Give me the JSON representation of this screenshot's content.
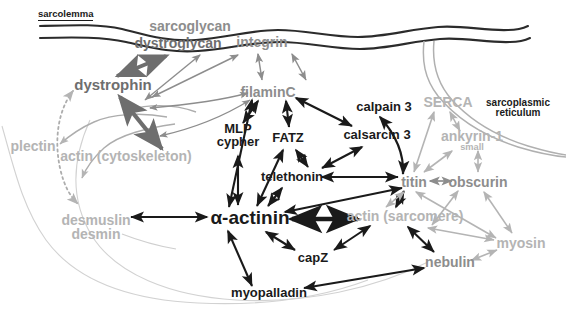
{
  "figure": {
    "type": "biological-interaction-diagram",
    "background_color": "#ffffff"
  },
  "colors": {
    "black": "#1a1a1a",
    "dark_gray": "#6e6e6e",
    "mid_gray": "#8d8d8d",
    "light_gray": "#b4b4b4",
    "membrane": "#2b2b2b"
  },
  "structures": [
    {
      "id": "sarcolemma",
      "label": "sarcolemma",
      "tone": "black",
      "x": 70,
      "y": 16,
      "size": 9.5
    },
    {
      "id": "sarcoplasmic-reticulum",
      "label": "sarcoplasmic\nreticulum",
      "line1": "sarcoplasmic",
      "line2": "reticulum",
      "tone": "black",
      "x": 518,
      "y": 108,
      "size": 10
    }
  ],
  "nodes": [
    {
      "id": "sarcoglycan",
      "label": "sarcoglycan",
      "tone": "mid",
      "x": 190,
      "y": 26,
      "size": 14
    },
    {
      "id": "dystroglycan",
      "label": "dystroglycan",
      "tone": "dark",
      "x": 178,
      "y": 43,
      "size": 14
    },
    {
      "id": "integrin",
      "label": "integrin",
      "tone": "mid",
      "x": 262,
      "y": 42,
      "size": 14
    },
    {
      "id": "dystrophin",
      "label": "dystrophin",
      "tone": "dark",
      "x": 113,
      "y": 85,
      "size": 15
    },
    {
      "id": "filaminC",
      "label": "filaminC",
      "tone": "mid",
      "x": 268,
      "y": 92,
      "size": 14
    },
    {
      "id": "calpain-3",
      "label": "calpain 3",
      "tone": "black",
      "x": 384,
      "y": 107,
      "size": 13
    },
    {
      "id": "serca",
      "label": "SERCA",
      "tone": "light",
      "x": 448,
      "y": 102,
      "size": 14
    },
    {
      "id": "plectin",
      "label": "plectin",
      "tone": "light",
      "x": 33,
      "y": 146,
      "size": 14
    },
    {
      "id": "mlp-cypher",
      "label": "MLP cypher",
      "line1": "MLP",
      "line2": "cypher",
      "tone": "black",
      "x": 238,
      "y": 135,
      "size": 13
    },
    {
      "id": "fatz",
      "label": "FATZ",
      "tone": "black",
      "x": 288,
      "y": 138,
      "size": 13
    },
    {
      "id": "calsarcin-3",
      "label": "calsarcin 3",
      "tone": "black",
      "x": 377,
      "y": 135,
      "size": 13
    },
    {
      "id": "ankyrin-1-small",
      "label": "ankyrin-1small",
      "base": "ankyrin-1",
      "subscript": "small",
      "tone": "light",
      "x": 472,
      "y": 141,
      "size": 14
    },
    {
      "id": "actin-cytoskeleton",
      "label": "actin (cytoskeleton)",
      "tone": "light",
      "x": 126,
      "y": 156,
      "size": 14
    },
    {
      "id": "telethonin",
      "label": "telethonin",
      "tone": "black",
      "x": 292,
      "y": 177,
      "size": 13
    },
    {
      "id": "titin",
      "label": "titin",
      "tone": "mid",
      "x": 414,
      "y": 182,
      "size": 14
    },
    {
      "id": "obscurin",
      "label": "obscurin",
      "tone": "mid",
      "x": 478,
      "y": 182,
      "size": 14
    },
    {
      "id": "alpha-actinin",
      "label": "α-actinin",
      "tone": "black",
      "x": 250,
      "y": 218,
      "size": 19
    },
    {
      "id": "actin-sarcomere",
      "label": "actin (sarcomere)",
      "tone": "light",
      "x": 405,
      "y": 216,
      "size": 14
    },
    {
      "id": "desmuslin-desmin",
      "label": "desmuslin desmin",
      "line1": "desmuslin",
      "line2": "desmin",
      "tone": "light",
      "x": 96,
      "y": 227,
      "size": 14
    },
    {
      "id": "myosin",
      "label": "myosin",
      "tone": "light",
      "x": 521,
      "y": 243,
      "size": 14
    },
    {
      "id": "capz",
      "label": "capZ",
      "tone": "black",
      "x": 313,
      "y": 258,
      "size": 13
    },
    {
      "id": "nebulin",
      "label": "nebulin",
      "tone": "mid",
      "x": 450,
      "y": 262,
      "size": 14
    },
    {
      "id": "myopalladin",
      "label": "myopalladin",
      "tone": "black",
      "x": 269,
      "y": 293,
      "size": 13
    }
  ],
  "edges": [
    {
      "from": "dystroglycan",
      "to": "dystrophin",
      "arrow": "double",
      "tone": "dark",
      "weight": "thick"
    },
    {
      "from": "integrin",
      "to": "filaminC",
      "arrow": "double",
      "tone": "mid",
      "weight": "thin"
    },
    {
      "from": "integrin",
      "to": "filaminC-right",
      "arrow": "double",
      "tone": "mid",
      "weight": "thin"
    },
    {
      "from": "dystroglycan",
      "to": "actin-cytoskeleton",
      "arrow": "double",
      "tone": "mid",
      "weight": "thin"
    },
    {
      "from": "integrin-left",
      "to": "actin-cytoskeleton",
      "arrow": "double",
      "tone": "mid",
      "weight": "thin"
    },
    {
      "from": "dystrophin",
      "to": "actin-cytoskeleton",
      "arrow": "double",
      "tone": "dark",
      "weight": "thick"
    },
    {
      "from": "plectin",
      "to": "actin-cytoskeleton",
      "arrow": "double",
      "tone": "light",
      "weight": "thin"
    },
    {
      "from": "plectin",
      "to": "desmuslin-desmin",
      "arrow": "double",
      "tone": "light",
      "weight": "dotted"
    },
    {
      "from": "filaminC",
      "to": "mlp-cypher",
      "arrow": "double",
      "tone": "black",
      "weight": "thin"
    },
    {
      "from": "filaminC",
      "to": "fatz",
      "arrow": "double",
      "tone": "black",
      "weight": "thin"
    },
    {
      "from": "filaminC",
      "to": "calsarcin-3",
      "arrow": "double",
      "tone": "black",
      "weight": "thin"
    },
    {
      "from": "filaminC",
      "to": "alpha-actinin",
      "arrow": "double",
      "tone": "black",
      "weight": "thin"
    },
    {
      "from": "fatz",
      "to": "telethonin",
      "arrow": "double",
      "tone": "black",
      "weight": "thin"
    },
    {
      "from": "fatz",
      "to": "alpha-actinin",
      "arrow": "double",
      "tone": "black",
      "weight": "thin"
    },
    {
      "from": "mlp-cypher",
      "to": "alpha-actinin",
      "arrow": "double",
      "tone": "black",
      "weight": "thin"
    },
    {
      "from": "calsarcin-3",
      "to": "telethonin",
      "arrow": "double",
      "tone": "black",
      "weight": "thin"
    },
    {
      "from": "calpain-3",
      "to": "titin",
      "arrow": "double",
      "tone": "black",
      "weight": "curved"
    },
    {
      "from": "telethonin",
      "to": "alpha-actinin",
      "arrow": "double",
      "tone": "black",
      "weight": "thin"
    },
    {
      "from": "telethonin",
      "to": "titin",
      "arrow": "double",
      "tone": "black",
      "weight": "thin"
    },
    {
      "from": "alpha-actinin",
      "to": "titin",
      "arrow": "double",
      "tone": "black",
      "weight": "thin"
    },
    {
      "from": "alpha-actinin",
      "to": "actin-sarcomere",
      "arrow": "double",
      "tone": "black",
      "weight": "thick"
    },
    {
      "from": "alpha-actinin",
      "to": "desmuslin-desmin",
      "arrow": "double",
      "tone": "black",
      "weight": "thin"
    },
    {
      "from": "alpha-actinin",
      "to": "capz",
      "arrow": "double",
      "tone": "black",
      "weight": "thin"
    },
    {
      "from": "alpha-actinin",
      "to": "myopalladin",
      "arrow": "double",
      "tone": "black",
      "weight": "thin"
    },
    {
      "from": "actin-sarcomere",
      "to": "capz",
      "arrow": "double",
      "tone": "black",
      "weight": "thin"
    },
    {
      "from": "actin-sarcomere",
      "to": "titin",
      "arrow": "double",
      "tone": "black",
      "weight": "thin"
    },
    {
      "from": "actin-sarcomere",
      "to": "nebulin",
      "arrow": "double",
      "tone": "black",
      "weight": "thin"
    },
    {
      "from": "nebulin",
      "to": "myopalladin",
      "arrow": "double",
      "tone": "black",
      "weight": "thin"
    },
    {
      "from": "nebulin",
      "to": "myosin",
      "arrow": "double",
      "tone": "light",
      "weight": "thin"
    },
    {
      "from": "titin",
      "to": "obscurin",
      "arrow": "double",
      "tone": "mid",
      "weight": "thin"
    },
    {
      "from": "titin",
      "to": "myosin",
      "arrow": "double",
      "tone": "light",
      "weight": "thin"
    },
    {
      "from": "titin",
      "to": "actin-sarcomere",
      "arrow": "double",
      "tone": "light",
      "weight": "thin"
    },
    {
      "from": "obscurin",
      "to": "myosin",
      "arrow": "double",
      "tone": "light",
      "weight": "thin"
    },
    {
      "from": "obscurin",
      "to": "actin-sarcomere",
      "arrow": "double",
      "tone": "light",
      "weight": "thin"
    },
    {
      "from": "serca",
      "to": "titin",
      "arrow": "double",
      "tone": "light",
      "weight": "thin"
    },
    {
      "from": "serca",
      "to": "ankyrin-1-small",
      "arrow": "double",
      "tone": "light",
      "weight": "thin"
    },
    {
      "from": "ankyrin-1-small",
      "to": "obscurin",
      "arrow": "double",
      "tone": "light",
      "weight": "thin"
    },
    {
      "from": "ankyrin-1-small",
      "to": "titin",
      "arrow": "double",
      "tone": "light",
      "weight": "thin"
    }
  ]
}
